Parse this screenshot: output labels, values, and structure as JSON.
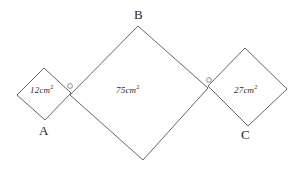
{
  "figure": {
    "type": "geometry-diagram",
    "background_color": "#ffffff",
    "stroke_color": "#555555",
    "text_color": "#2b2b2b",
    "shapes": [
      {
        "id": "square-left",
        "name": "small-left-square",
        "area_label": "12cm",
        "area_exponent": "2",
        "points": "17,95 44,68 71,93 45,120"
      },
      {
        "id": "square-middle",
        "name": "large-middle-square",
        "area_label": "75cm",
        "area_exponent": "2",
        "points": "138,26 208,88 143,160 70,95"
      },
      {
        "id": "square-right",
        "name": "medium-right-square",
        "area_label": "27cm",
        "area_exponent": "2",
        "points": "208,86 245,48 287,89 248,126"
      }
    ],
    "vertex_labels": [
      {
        "id": "vertex-a",
        "text": "A"
      },
      {
        "id": "vertex-b",
        "text": "B"
      },
      {
        "id": "vertex-c",
        "text": "C"
      }
    ],
    "angle_marks": [
      {
        "id": "angle-mark-left",
        "cx": 70,
        "cy": 86,
        "r": 2.4
      },
      {
        "id": "angle-mark-right",
        "cx": 209,
        "cy": 80,
        "r": 2.4
      }
    ]
  }
}
